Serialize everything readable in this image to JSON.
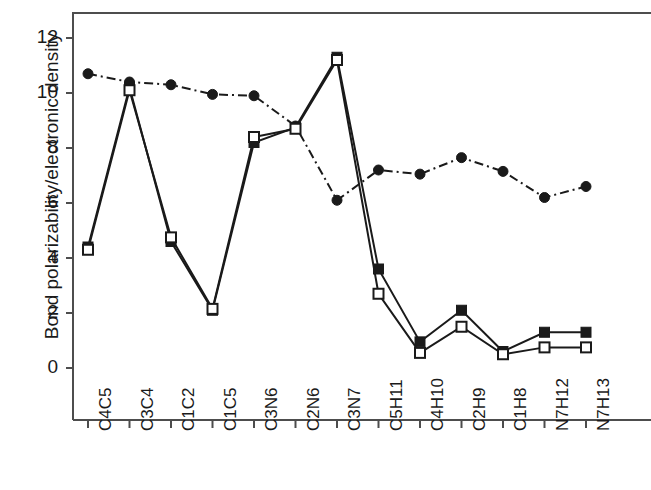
{
  "chart_data": {
    "type": "line",
    "title": "",
    "xlabel": "",
    "ylabel": "Bond polarizability/electronic density",
    "categories": [
      "C4C5",
      "C3C4",
      "C1C2",
      "C1C5",
      "C3N6",
      "C2N6",
      "C3N7",
      "C5H11",
      "C4H10",
      "C2H9",
      "C1H8",
      "N7H12",
      "N7H13"
    ],
    "ylim": [
      0,
      13
    ],
    "xlim": [
      -0.6,
      12.6
    ],
    "yticks": [
      0,
      2,
      4,
      6,
      8,
      10,
      12
    ],
    "ytick_labels": [
      "0",
      "2",
      "4",
      "6",
      "8",
      "10",
      "12"
    ],
    "grid": false,
    "legend": "none",
    "series": [
      {
        "name": "circle-dashdot-series",
        "marker": "filled-circle",
        "linestyle": "dash-dot",
        "color": "#1a1a1a",
        "values": [
          10.7,
          10.4,
          10.3,
          9.95,
          9.9,
          8.8,
          6.1,
          7.2,
          7.05,
          7.65,
          7.15,
          6.2,
          6.6
        ]
      },
      {
        "name": "filled-square-series",
        "marker": "filled-square",
        "linestyle": "solid",
        "color": "#1a1a1a",
        "values": [
          4.4,
          10.2,
          4.6,
          2.1,
          8.2,
          8.75,
          11.3,
          3.6,
          0.95,
          2.1,
          0.6,
          1.3,
          1.3
        ]
      },
      {
        "name": "open-square-series",
        "marker": "open-square",
        "linestyle": "solid",
        "color": "#1a1a1a",
        "values": [
          4.3,
          10.1,
          4.75,
          2.15,
          8.4,
          8.7,
          11.2,
          2.7,
          0.55,
          1.5,
          0.5,
          0.75,
          0.75
        ]
      }
    ]
  },
  "axes": {
    "frame_color": "#4d4d4d",
    "tick_color": "#4d4d4d",
    "line_color": "#1a1a1a"
  }
}
